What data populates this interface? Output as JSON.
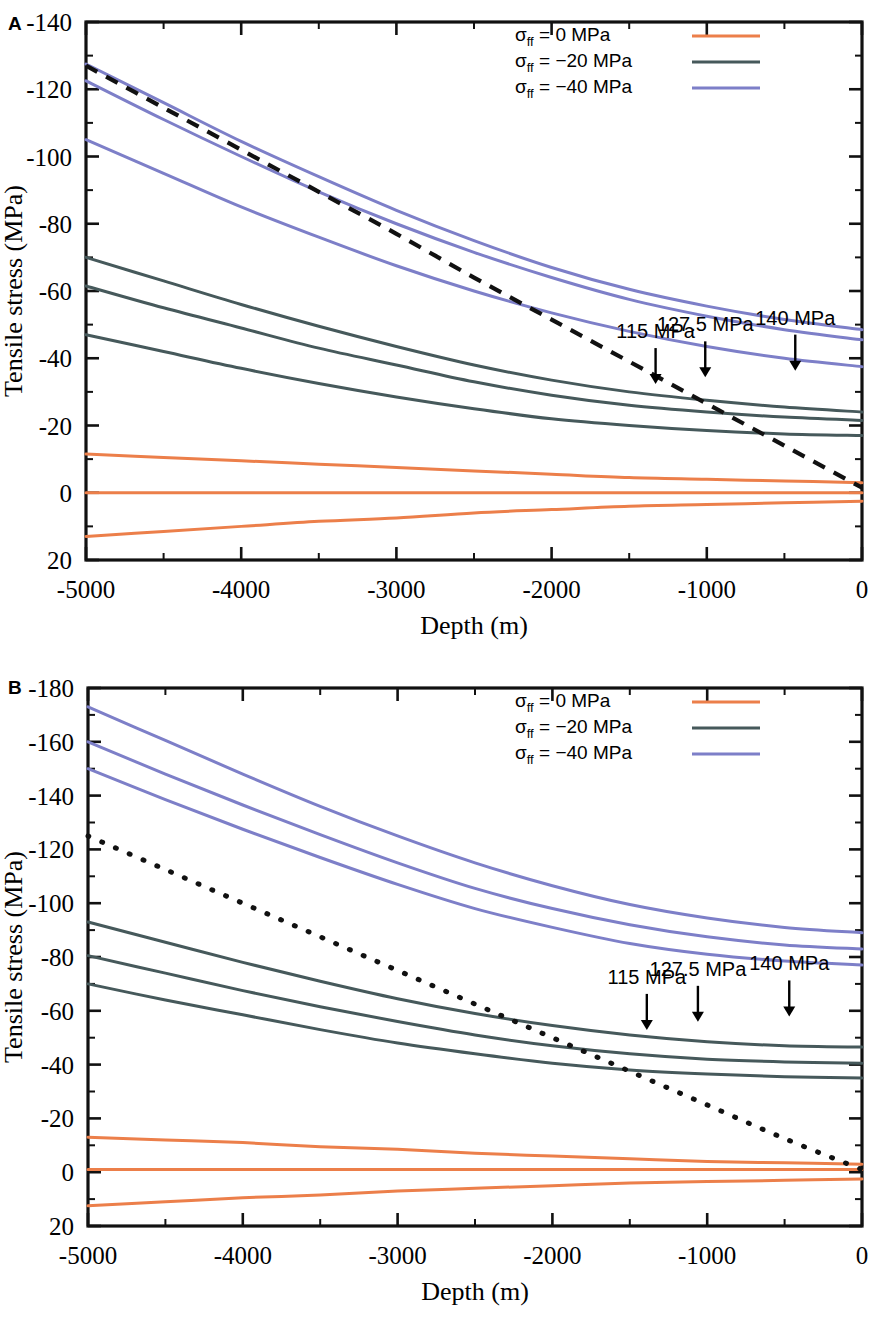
{
  "figure": {
    "panels": [
      {
        "id": "A",
        "letter": "A",
        "xlabel": "Depth (m)",
        "ylabel": "Tensile stress (MPa)",
        "xticks": [
          -5000,
          -4000,
          -3000,
          -2000,
          -1000,
          0
        ],
        "xtick_labels": [
          "-5000",
          "-4000",
          "-3000",
          "-2000",
          "-1000",
          "0"
        ],
        "yticks": [
          -140,
          -120,
          -100,
          -80,
          -60,
          -40,
          -20,
          0,
          20
        ],
        "ytick_labels": [
          "-140",
          "-120",
          "-100",
          "-80",
          "-60",
          "-40",
          "-20",
          "0",
          "20"
        ],
        "xlim": [
          -5000,
          0
        ],
        "ylim": [
          -140,
          20
        ],
        "legend": [
          {
            "label_prefix": "σ",
            "label_sub": "ff",
            "label_eq": "=",
            "value": "0 MPa",
            "color": "#ec7f4a"
          },
          {
            "label_prefix": "σ",
            "label_sub": "ff",
            "label_eq": "=",
            "value": "−20 MPa",
            "color": "#46595b"
          },
          {
            "label_prefix": "σ",
            "label_sub": "ff",
            "label_eq": "=",
            "value": "−40 MPa",
            "color": "#7d7fc8"
          }
        ],
        "annotations": [
          {
            "text": "115 MPa",
            "x": -1330,
            "y": -46
          },
          {
            "text": "127.5 MPa",
            "x": -1010,
            "y": -48
          },
          {
            "text": "140 MPa",
            "x": -430,
            "y": -50
          }
        ]
      },
      {
        "id": "B",
        "letter": "B",
        "xlabel": "Depth (m)",
        "ylabel": "Tensile stress (MPa)",
        "xticks": [
          -5000,
          -4000,
          -3000,
          -2000,
          -1000,
          0
        ],
        "xtick_labels": [
          "-5000",
          "-4000",
          "-3000",
          "-2000",
          "-1000",
          "0"
        ],
        "yticks": [
          -180,
          -160,
          -140,
          -120,
          -100,
          -80,
          -60,
          -40,
          -20,
          0,
          20
        ],
        "ytick_labels": [
          "-180",
          "-160",
          "-140",
          "-120",
          "-100",
          "-80",
          "-60",
          "-40",
          "-20",
          "0",
          "20"
        ],
        "xlim": [
          -5000,
          0
        ],
        "ylim": [
          -180,
          20
        ],
        "legend": [
          {
            "label_prefix": "σ",
            "label_sub": "ff",
            "label_eq": "=",
            "value": "0 MPa",
            "color": "#ec7f4a"
          },
          {
            "label_prefix": "σ",
            "label_sub": "ff",
            "label_eq": "=",
            "value": "−20 MPa",
            "color": "#46595b"
          },
          {
            "label_prefix": "σ",
            "label_sub": "ff",
            "label_eq": "=",
            "value": "−40 MPa",
            "color": "#7d7fc8"
          }
        ],
        "annotations": [
          {
            "text": "115 MPa",
            "x": -1390,
            "y": -70
          },
          {
            "text": "127.5 MPa",
            "x": -1060,
            "y": -73
          },
          {
            "text": "140 MPa",
            "x": -470,
            "y": -75
          }
        ]
      }
    ]
  },
  "chart_data": [
    {
      "type": "line",
      "panel": "A",
      "title": "",
      "xlabel": "Depth (m)",
      "ylabel": "Tensile stress (MPa)",
      "xlim": [
        -5000,
        0
      ],
      "ylim": [
        -140,
        20
      ],
      "y_axis_inverted": true,
      "grid": false,
      "legend_position": "top-right",
      "x": [
        -5000,
        -4500,
        -4000,
        -3500,
        -3000,
        -2500,
        -2000,
        -1500,
        -1000,
        -500,
        0
      ],
      "series": [
        {
          "name": "sigma_ff = -40 MPa, 140 MPa",
          "color": "#7d7fc8",
          "values": [
            -127.5,
            -116.0,
            -104.5,
            -94.0,
            -84.0,
            -75.0,
            -67.0,
            -60.5,
            -55.5,
            -51.5,
            -48.5
          ]
        },
        {
          "name": "sigma_ff = -40 MPa, 127.5 MPa",
          "color": "#7d7fc8",
          "values": [
            -122.5,
            -111.0,
            -100.0,
            -89.5,
            -80.0,
            -71.5,
            -64.0,
            -57.5,
            -52.5,
            -48.5,
            -45.5
          ]
        },
        {
          "name": "sigma_ff = -40 MPa, 115 MPa",
          "color": "#7d7fc8",
          "values": [
            -105.0,
            -95.0,
            -85.0,
            -76.0,
            -67.5,
            -60.0,
            -53.5,
            -48.0,
            -43.5,
            -40.0,
            -37.5
          ]
        },
        {
          "name": "sigma_ff = -20 MPa, 140 MPa",
          "color": "#46595b",
          "values": [
            -70.0,
            -63.0,
            -56.0,
            -49.5,
            -43.5,
            -38.0,
            -33.5,
            -30.0,
            -27.5,
            -25.5,
            -24.0
          ]
        },
        {
          "name": "sigma_ff = -20 MPa, 127.5 MPa",
          "color": "#46595b",
          "values": [
            -61.5,
            -55.0,
            -49.0,
            -43.0,
            -38.0,
            -33.0,
            -29.0,
            -26.0,
            -24.0,
            -22.5,
            -21.5
          ]
        },
        {
          "name": "sigma_ff = -20 MPa, 115 MPa",
          "color": "#46595b",
          "values": [
            -47.0,
            -42.0,
            -37.0,
            -32.5,
            -28.5,
            -25.0,
            -22.0,
            -20.0,
            -18.5,
            -17.5,
            -17.0
          ]
        },
        {
          "name": "sigma_ff = 0 MPa, 140 MPa",
          "color": "#ec7f4a",
          "values": [
            -11.5,
            -10.5,
            -9.5,
            -8.5,
            -7.5,
            -6.5,
            -5.5,
            -4.5,
            -4.0,
            -3.5,
            -3.0
          ]
        },
        {
          "name": "sigma_ff = 0 MPa, 127.5 MPa",
          "color": "#ec7f4a",
          "values": [
            0.0,
            0.0,
            0.0,
            0.0,
            0.0,
            0.0,
            0.0,
            0.0,
            0.0,
            0.0,
            0.0
          ]
        },
        {
          "name": "sigma_ff = 0 MPa, 115 MPa",
          "color": "#ec7f4a",
          "values": [
            13.0,
            11.5,
            10.0,
            8.5,
            7.5,
            6.0,
            5.0,
            4.0,
            3.5,
            3.0,
            2.5
          ]
        },
        {
          "name": "lithostatic guide (dashed)",
          "color": "#111111",
          "style": "dashed",
          "values": [
            -127.0,
            -114.5,
            -102.0,
            -89.5,
            -77.0,
            -64.0,
            -51.5,
            -39.0,
            -26.5,
            -14.0,
            -1.5
          ]
        }
      ],
      "annotations": [
        {
          "text": "115 MPa",
          "x": -1330,
          "y": -46
        },
        {
          "text": "127.5 MPa",
          "x": -1010,
          "y": -48
        },
        {
          "text": "140 MPa",
          "x": -430,
          "y": -50
        }
      ]
    },
    {
      "type": "line",
      "panel": "B",
      "title": "",
      "xlabel": "Depth (m)",
      "ylabel": "Tensile stress (MPa)",
      "xlim": [
        -5000,
        0
      ],
      "ylim": [
        -180,
        20
      ],
      "y_axis_inverted": true,
      "grid": false,
      "legend_position": "top-right",
      "x": [
        -5000,
        -4500,
        -4000,
        -3500,
        -3000,
        -2500,
        -2000,
        -1500,
        -1000,
        -500,
        0
      ],
      "series": [
        {
          "name": "sigma_ff = -40 MPa, 140 MPa",
          "color": "#7d7fc8",
          "values": [
            -173.0,
            -160.5,
            -148.0,
            -136.0,
            -125.0,
            -115.0,
            -106.5,
            -99.5,
            -94.5,
            -91.0,
            -89.0
          ]
        },
        {
          "name": "sigma_ff = -40 MPa, 127.5 MPa",
          "color": "#7d7fc8",
          "values": [
            -160.0,
            -148.0,
            -136.5,
            -125.5,
            -115.0,
            -105.5,
            -98.0,
            -92.0,
            -87.5,
            -84.5,
            -83.0
          ]
        },
        {
          "name": "sigma_ff = -40 MPa, 115 MPa",
          "color": "#7d7fc8",
          "values": [
            -150.0,
            -138.5,
            -127.5,
            -117.0,
            -107.0,
            -98.0,
            -91.0,
            -85.0,
            -81.0,
            -78.5,
            -77.0
          ]
        },
        {
          "name": "sigma_ff = -20 MPa, 140 MPa",
          "color": "#46595b",
          "values": [
            -93.0,
            -85.5,
            -78.0,
            -71.0,
            -64.5,
            -59.0,
            -54.5,
            -51.0,
            -48.5,
            -47.0,
            -46.5
          ]
        },
        {
          "name": "sigma_ff = -20 MPa, 127.5 MPa",
          "color": "#46595b",
          "values": [
            -80.5,
            -74.0,
            -67.5,
            -61.5,
            -56.0,
            -51.0,
            -47.0,
            -44.0,
            -42.0,
            -41.0,
            -40.5
          ]
        },
        {
          "name": "sigma_ff = -20 MPa, 115 MPa",
          "color": "#46595b",
          "values": [
            -70.0,
            -64.0,
            -58.5,
            -53.0,
            -48.0,
            -44.0,
            -40.5,
            -38.0,
            -36.5,
            -35.5,
            -35.0
          ]
        },
        {
          "name": "sigma_ff = 0 MPa, 140 MPa",
          "color": "#ec7f4a",
          "values": [
            -13.0,
            -12.0,
            -11.0,
            -9.5,
            -8.5,
            -7.0,
            -6.0,
            -5.0,
            -4.0,
            -3.5,
            -3.0
          ]
        },
        {
          "name": "sigma_ff = 0 MPa, 127.5 MPa",
          "color": "#ec7f4a",
          "values": [
            -1.0,
            -1.0,
            -1.0,
            -1.0,
            -1.0,
            -1.0,
            -1.0,
            -1.0,
            -1.0,
            -1.0,
            -1.0
          ]
        },
        {
          "name": "sigma_ff = 0 MPa, 115 MPa",
          "color": "#ec7f4a",
          "values": [
            12.5,
            11.0,
            9.5,
            8.5,
            7.0,
            6.0,
            5.0,
            4.0,
            3.5,
            3.0,
            2.5
          ]
        },
        {
          "name": "lithostatic guide (dotted)",
          "color": "#111111",
          "style": "dotted",
          "values": [
            -125.0,
            -112.5,
            -100.0,
            -87.5,
            -75.0,
            -62.5,
            -50.0,
            -37.5,
            -25.0,
            -12.5,
            -1.0
          ]
        }
      ],
      "annotations": [
        {
          "text": "115 MPa",
          "x": -1390,
          "y": -70
        },
        {
          "text": "127.5 MPa",
          "x": -1060,
          "y": -73
        },
        {
          "text": "140 MPa",
          "x": -470,
          "y": -75
        }
      ]
    }
  ]
}
